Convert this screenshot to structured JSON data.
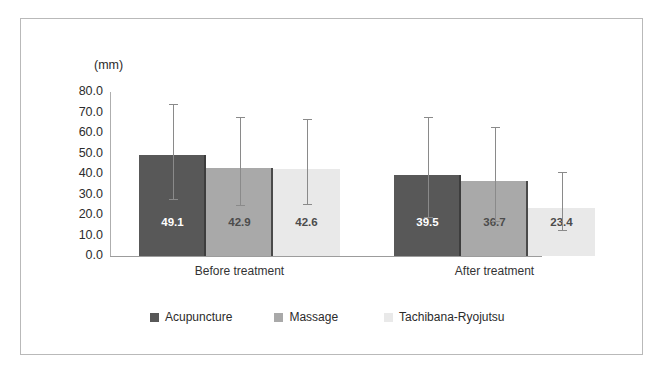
{
  "chart_data": {
    "type": "bar",
    "title": "",
    "subtitle": "",
    "unit_label": "(mm)",
    "xlabel": "",
    "ylabel": "",
    "categories": [
      "Before treatment",
      "After treatment"
    ],
    "series": [
      {
        "name": "Acupuncture",
        "color": "#585858",
        "values": [
          49.1,
          42.9
        ],
        "value_labels": [
          "49.1",
          "39.5"
        ]
      },
      {
        "name": "Massage",
        "color": "#a9a9a9",
        "values": [
          42.9,
          36.7
        ],
        "value_labels": [
          "42.9",
          "36.7"
        ]
      },
      {
        "name": "Tachibana-Ryojutsu",
        "color": "#e9e9e9",
        "values": [
          42.6,
          23.4
        ],
        "value_labels": [
          "42.6",
          "23.4"
        ]
      }
    ],
    "bars": [
      {
        "group": "Before treatment",
        "series": "Acupuncture",
        "value": 49.1,
        "label": "49.1",
        "err_upper": 74.0,
        "err_lower": 28.0
      },
      {
        "group": "Before treatment",
        "series": "Massage",
        "value": 42.9,
        "label": "42.9",
        "err_upper": 68.0,
        "err_lower": 25.0
      },
      {
        "group": "Before treatment",
        "series": "Tachibana-Ryojutsu",
        "value": 42.6,
        "label": "42.6",
        "err_upper": 67.0,
        "err_lower": 25.5
      },
      {
        "group": "After treatment",
        "series": "Acupuncture",
        "value": 39.5,
        "label": "39.5",
        "err_upper": 68.0,
        "err_lower": 19.0
      },
      {
        "group": "After treatment",
        "series": "Massage",
        "value": 36.7,
        "label": "36.7",
        "err_upper": 63.0,
        "err_lower": 17.0
      },
      {
        "group": "After treatment",
        "series": "Tachibana-Ryojutsu",
        "value": 23.4,
        "label": "23.4",
        "err_upper": 41.0,
        "err_lower": 12.5
      }
    ],
    "error_bars": true,
    "ylim": [
      0.0,
      80.0
    ],
    "ytick_step": 10.0,
    "ytick_labels": [
      "80.0",
      "70.0",
      "60.0",
      "50.0",
      "40.0",
      "30.0",
      "20.0",
      "10.0",
      "0.0"
    ],
    "grid": false,
    "legend_position": "bottom"
  },
  "legend": {
    "items": [
      {
        "label": "Acupuncture",
        "swatch": "#585858"
      },
      {
        "label": "Massage",
        "swatch": "#a9a9a9"
      },
      {
        "label": "Tachibana-Ryojutsu",
        "swatch": "#e9e9e9"
      }
    ]
  },
  "axis": {
    "unit": "(mm)"
  }
}
